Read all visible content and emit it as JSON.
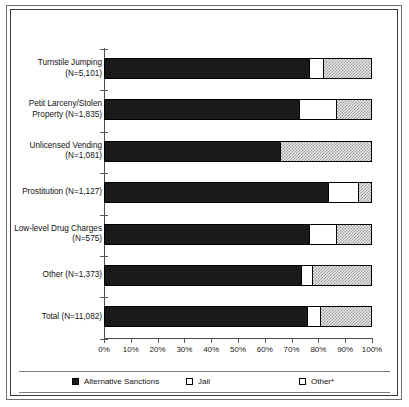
{
  "chart_data": {
    "type": "bar",
    "orientation": "horizontal",
    "stacked": true,
    "title": "",
    "xlabel": "",
    "ylabel": "",
    "xlim": [
      0,
      100
    ],
    "xticks": [
      "0%",
      "10%",
      "20%",
      "30%",
      "40%",
      "50%",
      "60%",
      "70%",
      "80%",
      "90%",
      "100%"
    ],
    "grid": false,
    "legend_position": "bottom",
    "categories": [
      "Turnstile Jumping\n(N=5,101)",
      "Petit Larceny/Stolen\nProperty (N=1,835)",
      "Unlicensed Vending\n(N=1,081)",
      "Prostitution (N=1,127)",
      "Low-level Drug Charges\n(N=575)",
      "Other (N=1,373)",
      "Total (N=11,082)"
    ],
    "series": [
      {
        "name": "Alternative Sanctions",
        "color": "#1a1a18",
        "values": [
          77,
          73,
          66,
          84,
          77,
          74,
          76
        ]
      },
      {
        "name": "Jail",
        "color": "#ffffff",
        "values": [
          5,
          14,
          0,
          11,
          10,
          4,
          5
        ]
      },
      {
        "name": "Other*",
        "color": "#d9d9d9",
        "values": [
          18,
          13,
          34,
          5,
          13,
          22,
          19
        ]
      }
    ]
  },
  "legend": {
    "entries": [
      {
        "label": "Alternative Sanctions",
        "swatch": "black-filled-square"
      },
      {
        "label": "Jail",
        "swatch": "white-open-square"
      },
      {
        "label": "Other*",
        "swatch": "hatched-square"
      }
    ]
  }
}
